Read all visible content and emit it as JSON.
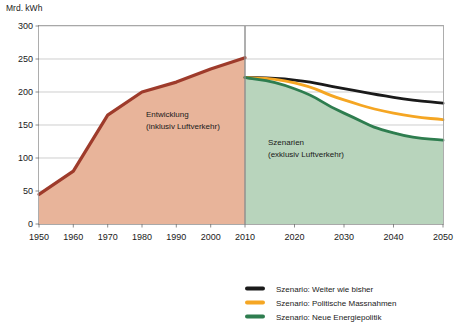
{
  "chart_data": {
    "type": "line",
    "title": "",
    "ylabel": "Mrd. kWh",
    "xlabel": "",
    "ylim": [
      0,
      300
    ],
    "xlim": [
      1950,
      2050
    ],
    "yticks": [
      0,
      50,
      100,
      150,
      200,
      250,
      300
    ],
    "xticks": [
      1950,
      1960,
      1970,
      1980,
      1990,
      2000,
      2010,
      2020,
      2030,
      2040,
      2050
    ],
    "grid": true,
    "legend_position": "bottom-right",
    "divider_x": 2010,
    "series": [
      {
        "name": "Entwicklung (inklusiv Luftverkehr)",
        "type": "area",
        "color": "#9E3B2B",
        "fill": "#E8B49A",
        "x": [
          1950,
          1960,
          1970,
          1980,
          1990,
          2000,
          2010
        ],
        "values": [
          45,
          80,
          165,
          200,
          215,
          235,
          252
        ]
      },
      {
        "name": "Szenario: Weiter wie bisher",
        "type": "line",
        "color": "#1a1a1a",
        "x": [
          2010,
          2020,
          2030,
          2040,
          2050
        ],
        "values": [
          222,
          218,
          205,
          192,
          183
        ]
      },
      {
        "name": "Szenario: Politische Massnahmen",
        "type": "line",
        "color": "#F5A623",
        "x": [
          2010,
          2020,
          2030,
          2040,
          2050
        ],
        "values": [
          222,
          214,
          188,
          168,
          158
        ]
      },
      {
        "name": "Szenario: Neue Energiepolitik",
        "type": "area",
        "color": "#2E7D4F",
        "fill": "#B8D4BC",
        "x": [
          2010,
          2020,
          2030,
          2040,
          2050
        ],
        "values": [
          222,
          205,
          168,
          138,
          127
        ]
      }
    ],
    "annotations": [
      {
        "id": "historic",
        "lines": [
          "Entwicklung",
          "(inklusiv Luftverkehr)"
        ],
        "x": 1987,
        "y": 130
      },
      {
        "id": "scenarios",
        "lines": [
          "Szenarien",
          "(exklusiv Luftverkehr)"
        ],
        "x": 2018,
        "y": 92
      }
    ],
    "legend": [
      {
        "label": "Szenario: Weiter wie bisher",
        "color": "#1a1a1a"
      },
      {
        "label": "Szenario: Politische Massnahmen",
        "color": "#F5A623"
      },
      {
        "label": "Szenario: Neue Energiepolitik",
        "color": "#2E7D4F"
      }
    ]
  },
  "axis": {
    "unit_label": "Mrd. kWh"
  },
  "annotations": {
    "historic_line1": "Entwicklung",
    "historic_line2": "(inklusiv Luftverkehr)",
    "scenarios_line1": "Szenarien",
    "scenarios_line2": "(exklusiv Luftverkehr)"
  },
  "legend": {
    "item0_label": "Szenario: Weiter wie bisher",
    "item1_label": "Szenario: Politische Massnahmen",
    "item2_label": "Szenario: Neue Energiepolitik"
  },
  "ytick_labels": [
    "0",
    "50",
    "100",
    "150",
    "200",
    "250",
    "300"
  ],
  "xtick_labels": [
    "1950",
    "1960",
    "1970",
    "1980",
    "1990",
    "2000",
    "2010",
    "2020",
    "2030",
    "2040",
    "2050"
  ],
  "colors": {
    "historic_line": "#9E3B2B",
    "historic_fill": "#E8B49A",
    "scenario_black": "#1a1a1a",
    "scenario_orange": "#F5A623",
    "scenario_green": "#2E7D4F",
    "scenario_fill": "#B8D4BC",
    "grid": "#b9b9b9",
    "frame": "#9a9a9a"
  }
}
